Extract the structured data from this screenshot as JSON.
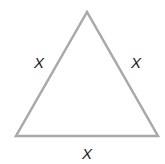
{
  "diagram": {
    "type": "equilateral-triangle",
    "stroke_color": "#a9a9a9",
    "fill_color": "#ffffff",
    "vertices": [
      [
        87,
        12
      ],
      [
        16,
        136
      ],
      [
        158,
        136
      ]
    ],
    "labels": {
      "left_side": "X",
      "right_side": "X",
      "bottom_side": "X"
    }
  }
}
